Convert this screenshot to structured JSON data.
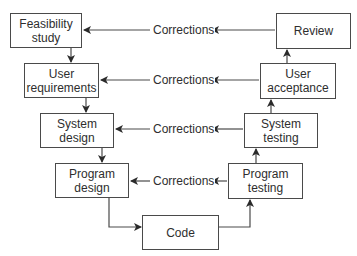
{
  "diagram": {
    "type": "V-model software development lifecycle",
    "boxes": [
      {
        "id": "feasibility",
        "label": "Feasibility\nstudy",
        "x": 10,
        "y": 13,
        "w": 72,
        "h": 35
      },
      {
        "id": "user-req",
        "label": "User\nrequirements",
        "x": 24,
        "y": 63,
        "w": 75,
        "h": 35
      },
      {
        "id": "system-design",
        "label": "System\ndesign",
        "x": 40,
        "y": 113,
        "w": 74,
        "h": 35
      },
      {
        "id": "program-design",
        "label": "Program\ndesign",
        "x": 55,
        "y": 163,
        "w": 74,
        "h": 35
      },
      {
        "id": "code",
        "label": "Code",
        "x": 142,
        "y": 215,
        "w": 77,
        "h": 35
      },
      {
        "id": "program-testing",
        "label": "Program\ntesting",
        "x": 228,
        "y": 163,
        "w": 75,
        "h": 36
      },
      {
        "id": "system-testing",
        "label": "System\ntesting",
        "x": 244,
        "y": 113,
        "w": 74,
        "h": 35
      },
      {
        "id": "user-acceptance",
        "label": "User\nacceptance",
        "x": 260,
        "y": 63,
        "w": 76,
        "h": 36
      },
      {
        "id": "review",
        "label": "Review",
        "x": 276,
        "y": 13,
        "w": 75,
        "h": 36
      }
    ],
    "corrections": [
      {
        "label": "Corrections",
        "y": 30
      },
      {
        "label": "Corrections",
        "y": 80
      },
      {
        "label": "Corrections",
        "y": 129
      },
      {
        "label": "Corrections",
        "y": 181
      }
    ]
  }
}
